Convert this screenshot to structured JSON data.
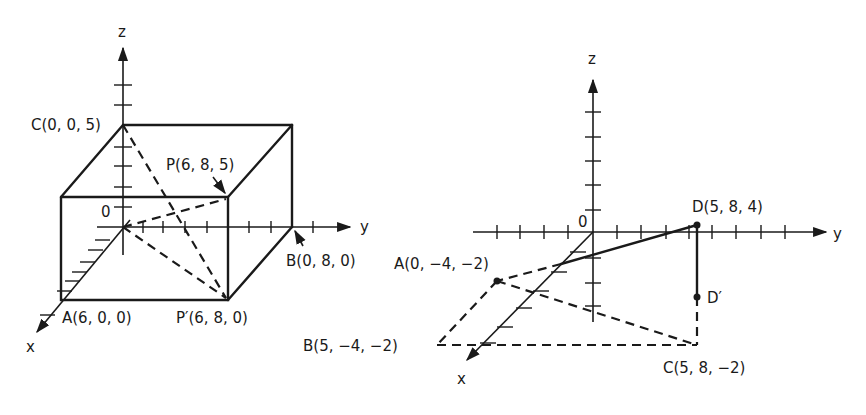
{
  "left_figure": {
    "axes": {
      "x": "x",
      "y": "y",
      "z": "z",
      "origin": "0"
    },
    "points": {
      "C": "C(0, 0, 5)",
      "P": "P(6, 8, 5)",
      "B": "B(0, 8, 0)",
      "A": "A(6, 0, 0)",
      "P_prime": "P′(6, 8, 0)"
    }
  },
  "right_figure": {
    "axes": {
      "x": "x",
      "y": "y",
      "z": "z",
      "origin": "0"
    },
    "points": {
      "D": "D(5, 8, 4)",
      "D_prime": "D′",
      "A": "A(0, −4, −2)",
      "B": "B(5, −4, −2)",
      "C": "C(5, 8, −2)"
    }
  },
  "colors": {
    "ink": "#1a1a1a",
    "background": "#ffffff"
  }
}
